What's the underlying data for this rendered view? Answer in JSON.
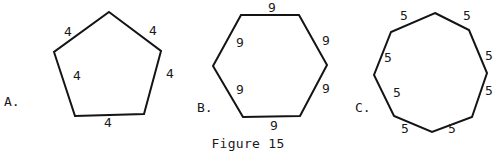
{
  "figure": {
    "caption": "Figure 15",
    "stroke_color": "#141414",
    "shapes": [
      {
        "id": "A",
        "letter": "A.",
        "name": "pentagon",
        "sides": 5,
        "side_length_label": "4",
        "points": [
          [
            109,
            12
          ],
          [
            161,
            51
          ],
          [
            144,
            114
          ],
          [
            75,
            116
          ],
          [
            54,
            52
          ]
        ],
        "letter_pos": [
          4,
          106
        ],
        "labels": [
          {
            "text": "4",
            "x": 64,
            "y": 36
          },
          {
            "text": "4",
            "x": 149,
            "y": 35
          },
          {
            "text": "4",
            "x": 166,
            "y": 78
          },
          {
            "text": "4",
            "x": 73,
            "y": 80
          },
          {
            "text": "4",
            "x": 104,
            "y": 127
          }
        ]
      },
      {
        "id": "B",
        "letter": "B.",
        "name": "hexagon",
        "sides": 6,
        "side_length_label": "9",
        "points": [
          [
            241,
            15
          ],
          [
            299,
            15
          ],
          [
            327,
            65
          ],
          [
            300,
            116
          ],
          [
            243,
            117
          ],
          [
            213,
            66
          ]
        ],
        "letter_pos": [
          197,
          112
        ],
        "labels": [
          {
            "text": "9",
            "x": 268,
            "y": 12
          },
          {
            "text": "9",
            "x": 236,
            "y": 47
          },
          {
            "text": "9",
            "x": 322,
            "y": 45
          },
          {
            "text": "9",
            "x": 236,
            "y": 94
          },
          {
            "text": "9",
            "x": 322,
            "y": 93
          },
          {
            "text": "9",
            "x": 270,
            "y": 130
          }
        ]
      },
      {
        "id": "C",
        "letter": "C.",
        "name": "octagon",
        "sides": 8,
        "side_length_label": "5",
        "points": [
          [
            435,
            13
          ],
          [
            469,
            30
          ],
          [
            487,
            73
          ],
          [
            472,
            117
          ],
          [
            432,
            132
          ],
          [
            394,
            116
          ],
          [
            374,
            75
          ],
          [
            391,
            32
          ]
        ],
        "letter_pos": [
          355,
          112
        ],
        "labels": [
          {
            "text": "5",
            "x": 400,
            "y": 20
          },
          {
            "text": "5",
            "x": 463,
            "y": 20
          },
          {
            "text": "5",
            "x": 485,
            "y": 60
          },
          {
            "text": "5",
            "x": 485,
            "y": 95
          },
          {
            "text": "5",
            "x": 384,
            "y": 62
          },
          {
            "text": "5",
            "x": 393,
            "y": 97
          },
          {
            "text": "5",
            "x": 401,
            "y": 133
          },
          {
            "text": "5",
            "x": 448,
            "y": 133
          }
        ]
      }
    ]
  }
}
